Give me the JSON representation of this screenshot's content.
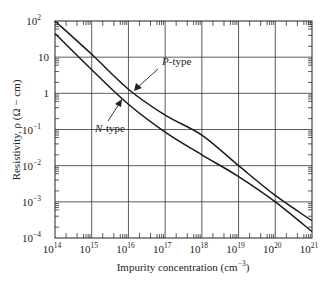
{
  "chart_data": {
    "type": "line",
    "title": "",
    "xlabel": "Impurity concentration (cm",
    "xlabel_sup": "−3",
    "xlabel_end": ")",
    "ylabel": "Resistivity, ρ (Ω − cm)",
    "xscale": "log",
    "yscale": "log",
    "xlim": [
      100000000000000.0,
      1e+21
    ],
    "ylim": [
      0.0001,
      100
    ],
    "grid": true,
    "x_ticks": [
      {
        "base": "10",
        "exp": "14"
      },
      {
        "base": "10",
        "exp": "15"
      },
      {
        "base": "10",
        "exp": "16"
      },
      {
        "base": "10",
        "exp": "17"
      },
      {
        "base": "10",
        "exp": "18"
      },
      {
        "base": "10",
        "exp": "19"
      },
      {
        "base": "10",
        "exp": "20"
      },
      {
        "base": "10",
        "exp": "21"
      }
    ],
    "y_ticks": [
      {
        "base": "10",
        "exp": "2",
        "value": 100
      },
      {
        "base": "10",
        "exp": "",
        "value": 10
      },
      {
        "base": "1",
        "exp": "",
        "value": 1
      },
      {
        "base": "10",
        "exp": "−1",
        "value": 0.1
      },
      {
        "base": "10",
        "exp": "−2",
        "value": 0.01
      },
      {
        "base": "10",
        "exp": "−3",
        "value": 0.001
      },
      {
        "base": "10",
        "exp": "−4",
        "value": 0.0001
      }
    ],
    "series": [
      {
        "name": "P-type",
        "label": "P",
        "label_suffix": "-type",
        "x": [
          100000000000000.0,
          1000000000000000.0,
          1e+16,
          1e+17,
          1e+18,
          1e+19,
          1e+20,
          1e+21
        ],
        "values": [
          100,
          12,
          1.3,
          0.25,
          0.07,
          0.01,
          0.0015,
          0.0003
        ]
      },
      {
        "name": "N-type",
        "label": "N",
        "label_suffix": "-type",
        "x": [
          100000000000000.0,
          1000000000000000.0,
          1e+16,
          1e+17,
          1e+18,
          1e+19,
          1e+20,
          1e+21
        ],
        "values": [
          45,
          4.5,
          0.5,
          0.085,
          0.02,
          0.005,
          0.001,
          0.00015
        ]
      }
    ],
    "annotations": [
      {
        "text": "P-type",
        "arrow_to": [
          8000000000000000.0,
          1.6
        ]
      },
      {
        "text": "N-type",
        "arrow_to": [
          6000000000000000.0,
          0.8
        ]
      }
    ]
  }
}
